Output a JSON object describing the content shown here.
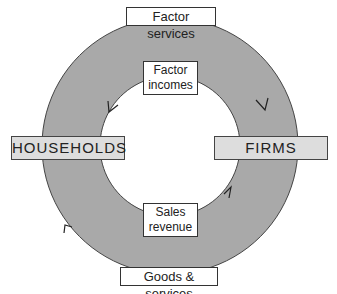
{
  "diagram": {
    "nodes": {
      "left": "HOUSEHOLDS",
      "right": "FIRMS"
    },
    "flows": {
      "outer_top": "Factor services",
      "inner_top_line1": "Factor",
      "inner_top_line2": "incomes",
      "inner_bottom_line1": "Sales",
      "inner_bottom_line2": "revenue",
      "outer_bottom": "Goods & services"
    },
    "colors": {
      "ring_fill": "#a9a9a9",
      "node_fill": "#dddddd",
      "stroke": "#333333"
    }
  }
}
